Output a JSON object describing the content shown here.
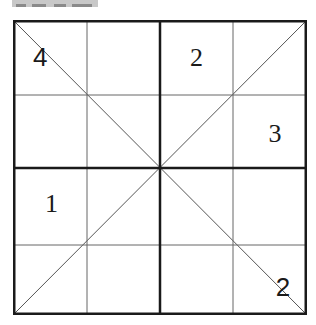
{
  "header": {
    "label_visible": "cropped gray label (text not legible)"
  },
  "puzzle": {
    "type": "4x4 diagonal sudoku",
    "size": 4,
    "box_rows": 2,
    "box_cols": 2,
    "diagonals": true,
    "grid": [
      [
        "4",
        "",
        "2",
        ""
      ],
      [
        "",
        "",
        "",
        "3"
      ],
      [
        "1",
        "",
        "",
        ""
      ],
      [
        "",
        "",
        "",
        "2"
      ]
    ],
    "colors": {
      "thick_line": "#1a1a1a",
      "thin_line": "#555555",
      "diagonal": "#555555",
      "digit": "#1a1a1a",
      "label_bg": "#c8c8c8"
    }
  }
}
